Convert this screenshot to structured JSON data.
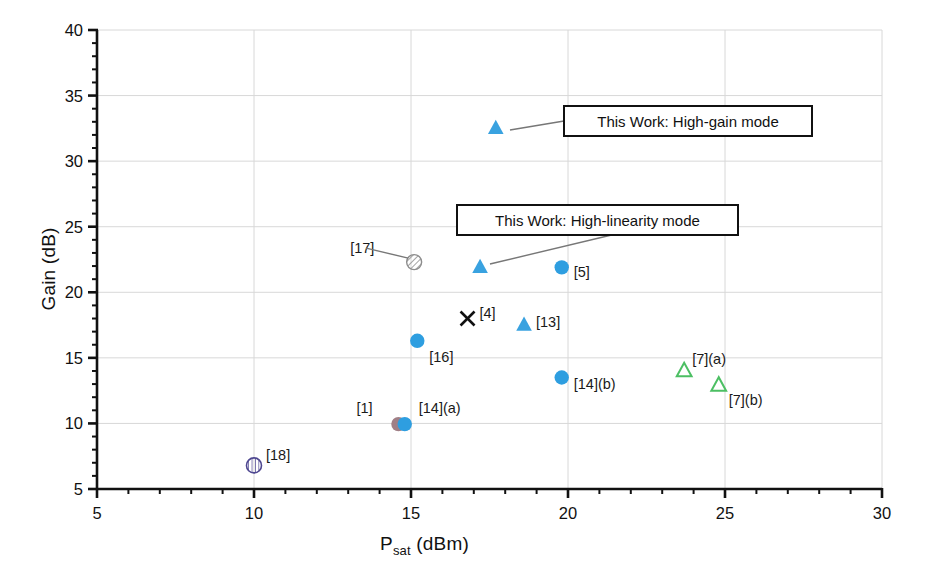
{
  "chart_data": {
    "type": "scatter",
    "title": "",
    "xlabel": "P_sat (dBm)",
    "xlabel_main": "P",
    "xlabel_sub": "sat",
    "xlabel_unit": " (dBm)",
    "ylabel": "Gain (dB)",
    "xlim": [
      5,
      30
    ],
    "ylim": [
      5,
      40
    ],
    "xticks": [
      5,
      10,
      15,
      20,
      25,
      30
    ],
    "yticks": [
      5,
      10,
      15,
      20,
      25,
      30,
      35,
      40
    ],
    "x_minor_step": 1,
    "y_minor_step": 1,
    "grid": true,
    "legend": "none",
    "points": [
      {
        "label": "",
        "x": 17.7,
        "y": 32.5,
        "marker": "triangle-filled",
        "color": "#39a2e0",
        "label_dx": 0,
        "label_dy": 0,
        "show_label": false
      },
      {
        "label": "[17]",
        "x": 15.1,
        "y": 22.3,
        "marker": "circle-hatched",
        "color": "#9a9a9a",
        "label_dx": -64,
        "label_dy": -14,
        "show_label": true
      },
      {
        "label": "",
        "x": 17.2,
        "y": 21.9,
        "marker": "triangle-filled",
        "color": "#39a2e0",
        "label_dx": 0,
        "label_dy": 0,
        "show_label": false
      },
      {
        "label": "[5]",
        "x": 19.8,
        "y": 21.9,
        "marker": "circle-filled",
        "color": "#2e9ee0",
        "label_dx": 12,
        "label_dy": 5,
        "show_label": true
      },
      {
        "label": "[4]",
        "x": 16.8,
        "y": 18.0,
        "marker": "x-cross",
        "color": "#111111",
        "label_dx": 12,
        "label_dy": -6,
        "show_label": true
      },
      {
        "label": "[13]",
        "x": 18.6,
        "y": 17.5,
        "marker": "triangle-filled",
        "color": "#39a2e0",
        "label_dx": 12,
        "label_dy": -3,
        "show_label": true
      },
      {
        "label": "[16]",
        "x": 15.2,
        "y": 16.3,
        "marker": "circle-filled",
        "color": "#2e9ee0",
        "label_dx": 12,
        "label_dy": 16,
        "show_label": true
      },
      {
        "label": "[7](a)",
        "x": 23.7,
        "y": 14.0,
        "marker": "triangle-open",
        "color": "#4cbf63",
        "label_dx": 8,
        "label_dy": -12,
        "show_label": true
      },
      {
        "label": "[14](b)",
        "x": 19.8,
        "y": 13.5,
        "marker": "circle-filled",
        "color": "#2e9ee0",
        "label_dx": 12,
        "label_dy": 6,
        "show_label": true
      },
      {
        "label": "[7](b)",
        "x": 24.8,
        "y": 12.9,
        "marker": "triangle-open",
        "color": "#4cbf63",
        "label_dx": 10,
        "label_dy": 15,
        "show_label": true
      },
      {
        "label": "[1]",
        "x": 14.6,
        "y": 9.95,
        "marker": "circle-filled",
        "color": "#a07f86",
        "label_dx": -42,
        "label_dy": -16,
        "show_label": true
      },
      {
        "label": "[14](a)",
        "x": 14.8,
        "y": 9.95,
        "marker": "circle-filled",
        "color": "#2e9ee0",
        "label_dx": 14,
        "label_dy": -16,
        "show_label": true
      },
      {
        "label": "[18]",
        "x": 10.0,
        "y": 6.8,
        "marker": "circle-hatched-purple",
        "color": "#6b63a6",
        "label_dx": 12,
        "label_dy": -10,
        "show_label": true
      }
    ],
    "annotations": [
      {
        "text": "This Work: High-gain mode",
        "box_x": 564,
        "box_y": 106,
        "box_w": 248,
        "box_h": 30,
        "anchor_x": 510,
        "anchor_y": 130
      },
      {
        "text": "This Work: High-linearity mode",
        "box_x": 457,
        "box_y": 205,
        "box_w": 281,
        "box_h": 30,
        "anchor_x": 490,
        "anchor_y": 264
      }
    ]
  }
}
